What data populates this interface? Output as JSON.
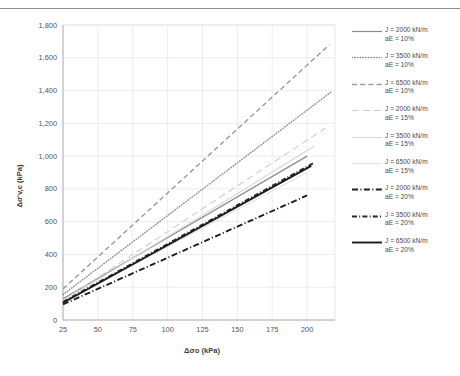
{
  "figure": {
    "top_rule": "horizontal-rule"
  },
  "chart_data": {
    "type": "line",
    "title": "",
    "xlabel": "Δσo (kPa)",
    "ylabel": "Δσ'v,c (kPa)",
    "xlim": [
      25,
      220
    ],
    "ylim": [
      0,
      1800
    ],
    "grid": true,
    "legend_position": "right",
    "xticks": [
      25,
      50,
      75,
      100,
      125,
      150,
      175,
      200
    ],
    "xtick_labels": [
      "25",
      "50",
      "75",
      "100",
      "125",
      "150",
      "175",
      "200"
    ],
    "yticks": [
      0,
      200,
      400,
      600,
      800,
      1000,
      1200,
      1400,
      1600,
      1800
    ],
    "ytick_labels": [
      "0",
      "200",
      "400",
      "600",
      "800",
      "1,000",
      "1,200",
      "1,400",
      "1,600",
      "1,800"
    ],
    "x": [
      25,
      220
    ],
    "series": [
      {
        "name": "J = 2000 kN/m aE = 10%",
        "legend_line1": "J = 2000 kN/m",
        "legend_line2": "aE = 10%",
        "style": "solid",
        "color": "#8c8c8c",
        "width": 1.2,
        "x": [
          25,
          200
        ],
        "values": [
          130,
          1000
        ]
      },
      {
        "name": "J = 3500 kN/m aE = 10%",
        "legend_line1": "J = 3500 kN/m",
        "legend_line2": "aE = 10%",
        "style": "dotted",
        "color": "#909090",
        "width": 1.5,
        "x": [
          25,
          217
        ],
        "values": [
          155,
          1390
        ]
      },
      {
        "name": "J = 6500 kN/m aE = 10%",
        "legend_line1": "J = 6500 kN/m",
        "legend_line2": "aE = 10%",
        "style": "dashed",
        "color": "#9a9a9a",
        "width": 1.4,
        "x": [
          25,
          216
        ],
        "values": [
          190,
          1680
        ]
      },
      {
        "name": "J = 2000 kN/m aE = 15%",
        "legend_line1": "J = 2000 kN/m",
        "legend_line2": "aE = 15%",
        "style": "longdash-light",
        "color": "#cfcfcf",
        "width": 1.1,
        "x": [
          25,
          213
        ],
        "values": [
          120,
          1170
        ]
      },
      {
        "name": "J = 3500 kN/m aE = 15%",
        "legend_line1": "J = 3500 kN/m",
        "legend_line2": "aE = 15%",
        "style": "solid-light",
        "color": "#d8d8d8",
        "width": 1.1,
        "x": [
          25,
          205
        ],
        "values": [
          115,
          1060
        ]
      },
      {
        "name": "J = 6500 kN/m aE = 15%",
        "legend_line1": "J = 6500 kN/m",
        "legend_line2": "aE = 15%",
        "style": "solid-lighter",
        "color": "#e2e2e2",
        "width": 1.1,
        "x": [
          25,
          200
        ],
        "values": [
          110,
          900
        ]
      },
      {
        "name": "J = 2000 kN/m aE = 20%",
        "legend_line1": "J = 2000 kN/m",
        "legend_line2": "aE = 20%",
        "style": "dashdot-thick",
        "color": "#1f1f1f",
        "width": 1.9,
        "x": [
          25,
          200
        ],
        "values": [
          95,
          760
        ]
      },
      {
        "name": "J = 3500 kN/m aE = 20%",
        "legend_line1": "J = 3500 kN/m",
        "legend_line2": "aE = 20%",
        "style": "dashdot-fine",
        "color": "#2a2a2a",
        "width": 1.9,
        "x": [
          25,
          205
        ],
        "values": [
          110,
          960
        ]
      },
      {
        "name": "J = 6500 kN/m aE = 20%",
        "legend_line1": "J = 6500 kN/m",
        "legend_line2": "aE = 20%",
        "style": "solid-black",
        "color": "#1a1a1a",
        "width": 1.9,
        "x": [
          25,
          203
        ],
        "values": [
          105,
          940
        ]
      }
    ]
  }
}
